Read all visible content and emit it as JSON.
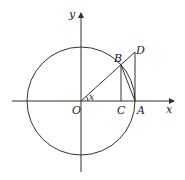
{
  "diagram": {
    "type": "unit-circle-trigonometry",
    "labels": {
      "y_axis": "y",
      "x_axis": "x",
      "origin": "O",
      "point_A": "A",
      "point_B": "B",
      "point_C": "C",
      "point_D": "D",
      "angle": "x"
    },
    "elements": [
      "circle centered at O",
      "x-axis with arrow",
      "y-axis with arrow",
      "ray OD through B",
      "segment BC perpendicular to x-axis",
      "segment DA perpendicular to x-axis (tangent at A)",
      "chord BA",
      "arc BA",
      "angle x at O"
    ],
    "colors": {
      "stroke": "#333333",
      "background": "#ffffff"
    }
  }
}
